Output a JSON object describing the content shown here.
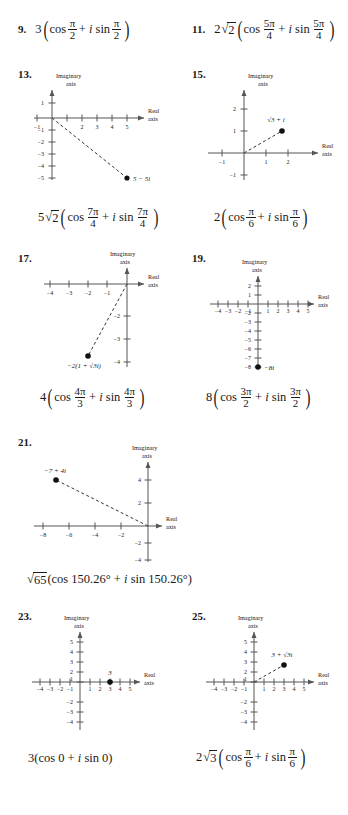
{
  "page": {
    "kind": "math-textbook-answer-key",
    "axis_labels": {
      "real": [
        "Real",
        "axis"
      ],
      "imaginary": [
        "Imaginary",
        "axis"
      ]
    }
  },
  "problems": [
    {
      "number": "9.",
      "type": "expression",
      "expression": {
        "coefficient": "3",
        "cos": "cos",
        "plus": "+",
        "i": "i",
        "sin": "sin",
        "angle_num": "π",
        "angle_den": "2"
      }
    },
    {
      "number": "11.",
      "type": "expression",
      "expression": {
        "coefficient": "2",
        "radicand": "2",
        "cos": "cos",
        "plus": "+",
        "i": "i",
        "sin": "sin",
        "angle_num": "5π",
        "angle_den": "4"
      }
    },
    {
      "number": "13.",
      "type": "graph",
      "point": {
        "label": "5 − 5i",
        "re": 5,
        "im": -5
      },
      "xticks": [
        -1,
        1,
        2,
        3,
        4,
        5
      ],
      "xtick_labels": [
        "−1",
        "",
        "2",
        "3",
        "4",
        "5"
      ],
      "yticks": [
        1,
        -1,
        -2,
        -3,
        -4,
        -5
      ],
      "ytick_labels": [
        "1",
        "−1",
        "−2",
        "−3",
        "−4",
        "−5"
      ],
      "answer": {
        "coefficient": "5",
        "radicand": "2",
        "cos": "cos",
        "plus": "+",
        "i": "i",
        "sin": "sin",
        "angle_num": "7π",
        "angle_den": "4"
      }
    },
    {
      "number": "15.",
      "type": "graph",
      "point": {
        "label": "√3 + i",
        "re": 1.732,
        "im": 1
      },
      "xticks": [
        -1,
        1,
        2
      ],
      "xtick_labels": [
        "−1",
        "1",
        "2"
      ],
      "yticks": [
        2,
        1,
        -1
      ],
      "ytick_labels": [
        "2",
        "1",
        "−1"
      ],
      "answer": {
        "coefficient": "2",
        "cos": "cos",
        "plus": "+",
        "i": "i",
        "sin": "sin",
        "angle_num": "π",
        "angle_den": "6"
      }
    },
    {
      "number": "17.",
      "type": "graph",
      "point": {
        "label": "−2(1 + √3i)",
        "re": -2,
        "im": -3.46
      },
      "xticks": [
        -4,
        -3,
        -2,
        -1
      ],
      "xtick_labels": [
        "−4",
        "−3",
        "−2",
        "−1"
      ],
      "yticks": [
        -2,
        -3,
        -4
      ],
      "ytick_labels": [
        "−2",
        "−3",
        "−4"
      ],
      "answer": {
        "coefficient": "4",
        "cos": "cos",
        "plus": "+",
        "i": "i",
        "sin": "sin",
        "angle_num": "4π",
        "angle_den": "3"
      }
    },
    {
      "number": "19.",
      "type": "graph",
      "point": {
        "label": "−8i",
        "re": 0,
        "im": -8
      },
      "xticks": [
        -4,
        -3,
        -2,
        -1,
        1,
        2,
        3,
        4,
        5
      ],
      "xtick_labels": [
        "−4",
        "−3",
        "−2",
        "−1",
        "1",
        "2",
        "3",
        "4",
        "5"
      ],
      "yticks": [
        2,
        1,
        -2,
        -3,
        -4,
        -5,
        -6,
        -7,
        -8
      ],
      "ytick_labels": [
        "2",
        "1",
        "−2",
        "−3",
        "−4",
        "−5",
        "−6",
        "−7",
        "−8"
      ],
      "answer": {
        "coefficient": "8",
        "cos": "cos",
        "plus": "+",
        "i": "i",
        "sin": "sin",
        "angle_num": "3π",
        "angle_den": "2"
      }
    },
    {
      "number": "21.",
      "type": "graph",
      "point": {
        "label": "−7 + 4i",
        "re": -7,
        "im": 4
      },
      "xticks": [
        -8,
        -6,
        -4,
        -2
      ],
      "xtick_labels": [
        "−8",
        "−6",
        "−4",
        "−2"
      ],
      "yticks": [
        4,
        2,
        -2,
        -4
      ],
      "ytick_labels": [
        "4",
        "2",
        "−2",
        "−4"
      ],
      "answer_text": {
        "radicand": "65",
        "open": "(",
        "cos": "cos",
        "angle1": "150.26°",
        "plus": "+",
        "i": "i",
        "sin": "sin",
        "angle2": "150.26°",
        "close": ")"
      }
    },
    {
      "number": "23.",
      "type": "graph",
      "point": {
        "label": "3",
        "re": 3,
        "im": 0
      },
      "xticks": [
        -4,
        -3,
        -2,
        -1,
        1,
        2,
        3,
        4,
        5
      ],
      "xtick_labels": [
        "−4",
        "−3",
        "−2",
        "−1",
        "1",
        "2",
        "3",
        "4",
        "5"
      ],
      "yticks": [
        5,
        4,
        3,
        2,
        1,
        -2,
        -3,
        -4
      ],
      "ytick_labels": [
        "5",
        "4",
        "3",
        "2",
        "1",
        "−2",
        "−3",
        "−4"
      ],
      "answer_text": {
        "full": "3(cos 0 + i sin 0)",
        "coefficient": "3",
        "open": "(",
        "cos": "cos",
        "angle1": "0",
        "plus": "+",
        "i": "i",
        "sin": "sin",
        "angle2": "0",
        "close": ")"
      }
    },
    {
      "number": "25.",
      "type": "graph",
      "point": {
        "label": "3 + √3i",
        "re": 3,
        "im": 1.732
      },
      "xticks": [
        -4,
        -3,
        -2,
        -1,
        1,
        2,
        3,
        4,
        5
      ],
      "xtick_labels": [
        "−4",
        "−3",
        "−2",
        "−1",
        "1",
        "2",
        "3",
        "4",
        "5"
      ],
      "yticks": [
        5,
        4,
        3,
        2,
        1,
        -2,
        -3,
        -4
      ],
      "ytick_labels": [
        "5",
        "4",
        "3",
        "2",
        "1",
        "−2",
        "−3",
        "−4"
      ],
      "answer": {
        "coefficient": "2",
        "radicand": "3",
        "cos": "cos",
        "plus": "+",
        "i": "i",
        "sin": "sin",
        "angle_num": "π",
        "angle_den": "6"
      }
    }
  ]
}
